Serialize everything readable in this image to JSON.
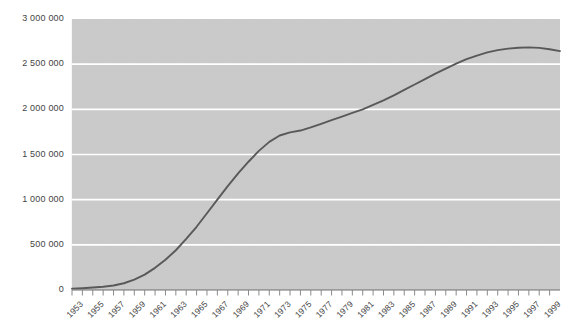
{
  "chart_data": {
    "type": "line",
    "title": "",
    "subtitle": "",
    "xlabel": "",
    "ylabel": "",
    "grid": true,
    "legend": false,
    "legend_position": "none",
    "xlim": [
      1953,
      2000
    ],
    "ylim": [
      0,
      3000000
    ],
    "y_ticks": [
      0,
      500000,
      1000000,
      1500000,
      2000000,
      2500000,
      3000000
    ],
    "y_tick_labels": [
      "0",
      "500 000",
      "1 000 000",
      "1 500 000",
      "2 000 000",
      "2 500 000",
      "3 000 000"
    ],
    "x_tick_labels": [
      "1953",
      "1955",
      "1957",
      "1959",
      "1961",
      "1963",
      "1965",
      "1967",
      "1969",
      "1971",
      "1973",
      "1975",
      "1977",
      "1979",
      "1981",
      "1983",
      "1985",
      "1987",
      "1989",
      "1991",
      "1993",
      "1995",
      "1997",
      "1999"
    ],
    "x": [
      1953,
      1954,
      1955,
      1956,
      1957,
      1958,
      1959,
      1960,
      1961,
      1962,
      1963,
      1964,
      1965,
      1966,
      1967,
      1968,
      1969,
      1970,
      1971,
      1972,
      1973,
      1974,
      1975,
      1976,
      1977,
      1978,
      1979,
      1980,
      1981,
      1982,
      1983,
      1984,
      1985,
      1986,
      1987,
      1988,
      1989,
      1990,
      1991,
      1992,
      1993,
      1994,
      1995,
      1996,
      1997,
      1998,
      1999,
      2000
    ],
    "series": [
      {
        "name": "Total",
        "color": "#595959",
        "values": [
          15000,
          20000,
          27000,
          36000,
          50000,
          75000,
          115000,
          170000,
          245000,
          335000,
          440000,
          565000,
          700000,
          850000,
          1000000,
          1150000,
          1290000,
          1420000,
          1540000,
          1640000,
          1710000,
          1745000,
          1765000,
          1800000,
          1840000,
          1880000,
          1920000,
          1960000,
          2000000,
          2050000,
          2100000,
          2155000,
          2215000,
          2275000,
          2335000,
          2395000,
          2450000,
          2505000,
          2555000,
          2595000,
          2630000,
          2655000,
          2672000,
          2682000,
          2686000,
          2680000,
          2665000,
          2645000
        ]
      }
    ],
    "colors": {
      "plot_background": "#c9c9c9",
      "gridline": "#ffffff",
      "line": "#595959",
      "axis": "#6e6e6e",
      "tick_label": "#444444",
      "page_background": "#ffffff"
    }
  }
}
